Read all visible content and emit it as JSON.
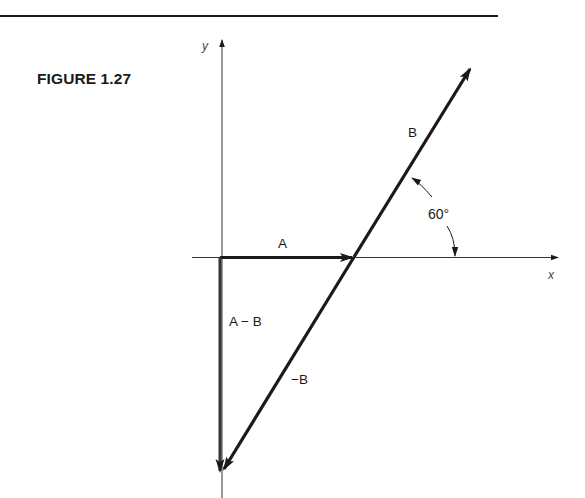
{
  "figure": {
    "title": "FIGURE 1.27",
    "axes": {
      "x_label": "x",
      "y_label": "y"
    },
    "vectors": [
      {
        "name": "A",
        "label": "A",
        "from": [
          220,
          257
        ],
        "to": [
          354,
          257
        ]
      },
      {
        "name": "B",
        "label": "B",
        "from": [
          354,
          257
        ],
        "to": [
          471,
          68
        ]
      },
      {
        "name": "-B",
        "label": "−B",
        "from": [
          354,
          257
        ],
        "to": [
          223,
          470
        ]
      },
      {
        "name": "A-B",
        "label": "A − B",
        "from": [
          220,
          257
        ],
        "to": [
          220,
          472
        ]
      }
    ],
    "angle": {
      "label": "60°",
      "value_degrees": 60
    },
    "colors": {
      "ink": "#1a1a1a",
      "axis": "#333333"
    }
  }
}
